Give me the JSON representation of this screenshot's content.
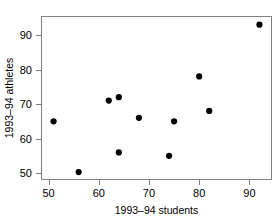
{
  "chart_data": {
    "type": "scatter",
    "title": "",
    "xlabel": "1993–94 students",
    "ylabel": "1993–94 athletes",
    "xlim": [
      48.5,
      94.5
    ],
    "ylim": [
      48.0,
      95.5
    ],
    "xticks": [
      50,
      60,
      70,
      80,
      90
    ],
    "xticklabels": [
      "50",
      "60",
      "70",
      "80",
      "90"
    ],
    "yticks": [
      50,
      60,
      70,
      80,
      90
    ],
    "yticklabels": [
      "50",
      "60",
      "70",
      "80",
      "90"
    ],
    "grid": false,
    "legend": null,
    "marker": "filled-circle",
    "marker_color": "#000000",
    "points": [
      {
        "x": 51,
        "y": 65
      },
      {
        "x": 56,
        "y": 50.3
      },
      {
        "x": 62,
        "y": 71
      },
      {
        "x": 64,
        "y": 72
      },
      {
        "x": 64,
        "y": 56
      },
      {
        "x": 68,
        "y": 66
      },
      {
        "x": 74,
        "y": 55
      },
      {
        "x": 75,
        "y": 65
      },
      {
        "x": 80,
        "y": 78
      },
      {
        "x": 82,
        "y": 68
      },
      {
        "x": 92,
        "y": 93
      }
    ]
  }
}
